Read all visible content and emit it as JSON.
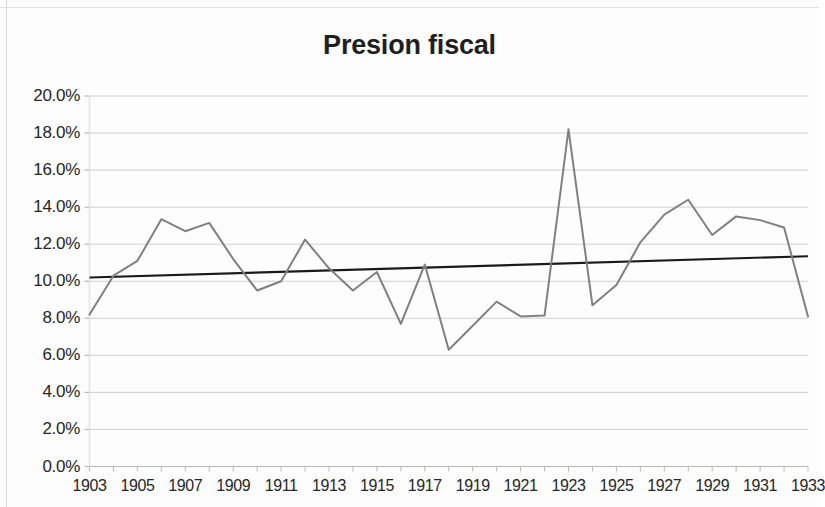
{
  "chart_data": {
    "type": "line",
    "title": "Presion fiscal",
    "xlabel": "",
    "ylabel": "",
    "xlim": [
      1903,
      1933
    ],
    "ylim": [
      0.0,
      20.0
    ],
    "y_unit": "%",
    "grid": true,
    "legend": "none",
    "y_ticks": [
      "0.0%",
      "2.0%",
      "4.0%",
      "6.0%",
      "8.0%",
      "10.0%",
      "12.0%",
      "14.0%",
      "16.0%",
      "18.0%",
      "20.0%"
    ],
    "y_tick_values": [
      0,
      2,
      4,
      6,
      8,
      10,
      12,
      14,
      16,
      18,
      20
    ],
    "x_ticks": [
      "1903",
      "1905",
      "1907",
      "1909",
      "1911",
      "1913",
      "1915",
      "1917",
      "1919",
      "1921",
      "1923",
      "1925",
      "1927",
      "1929",
      "1931",
      "1933"
    ],
    "x_tick_values": [
      1903,
      1905,
      1907,
      1909,
      1911,
      1913,
      1915,
      1917,
      1919,
      1921,
      1923,
      1925,
      1927,
      1929,
      1931,
      1933
    ],
    "x": [
      1903,
      1904,
      1905,
      1906,
      1907,
      1908,
      1909,
      1910,
      1911,
      1912,
      1913,
      1914,
      1915,
      1916,
      1917,
      1918,
      1919,
      1920,
      1921,
      1922,
      1923,
      1924,
      1925,
      1926,
      1927,
      1928,
      1929,
      1930,
      1931,
      1932,
      1933
    ],
    "series": [
      {
        "name": "Presion fiscal",
        "color": "#808080",
        "values": [
          8.2,
          10.3,
          11.1,
          13.35,
          12.7,
          13.15,
          11.2,
          9.5,
          10.0,
          12.25,
          10.7,
          9.5,
          10.5,
          7.7,
          10.9,
          6.3,
          7.6,
          8.9,
          8.1,
          8.15,
          18.2,
          8.7,
          9.8,
          12.1,
          13.6,
          14.4,
          12.5,
          13.5,
          13.3,
          12.9,
          8.1
        ],
        "note_peak_year": 1923,
        "note_peak_value": 18.2
      },
      {
        "name": "Tendencia lineal",
        "color": "#1a1a1a",
        "type": "trendline",
        "start_value": 10.2,
        "end_value": 11.35
      }
    ],
    "line_points": [
      {
        "year": 1903,
        "value": 8.2
      },
      {
        "year": 1904,
        "value": 10.3
      },
      {
        "year": 1905,
        "value": 11.1
      },
      {
        "year": 1906,
        "value": 13.35
      },
      {
        "year": 1907,
        "value": 12.7
      },
      {
        "year": 1908,
        "value": 13.15
      },
      {
        "year": 1909,
        "value": 11.2
      },
      {
        "year": 1910,
        "value": 9.5
      },
      {
        "year": 1911,
        "value": 10.0
      },
      {
        "year": 1912,
        "value": 12.25
      },
      {
        "year": 1913,
        "value": 10.7
      },
      {
        "year": 1914,
        "value": 9.5
      },
      {
        "year": 1915,
        "value": 10.5
      },
      {
        "year": 1916,
        "value": 7.7
      },
      {
        "year": 1917,
        "value": 10.9
      },
      {
        "year": 1918,
        "value": 6.3
      },
      {
        "year": 1919,
        "value": 7.6
      },
      {
        "year": 1920,
        "value": 8.9
      },
      {
        "year": 1921,
        "value": 8.1
      },
      {
        "year": 1922,
        "value": 8.15
      },
      {
        "year": 1923,
        "value": 18.2
      },
      {
        "year": 1924,
        "value": 8.7
      },
      {
        "year": 1925,
        "value": 9.8
      },
      {
        "year": 1926,
        "value": 12.1
      },
      {
        "year": 1927,
        "value": 13.6
      },
      {
        "year": 1928,
        "value": 14.4
      },
      {
        "year": 1929,
        "value": 12.5
      },
      {
        "year": 1930,
        "value": 13.5
      },
      {
        "year": 1931,
        "value": 13.3
      },
      {
        "year": 1932,
        "value": 12.9
      },
      {
        "year": 1933,
        "value": 8.1
      }
    ]
  },
  "colors": {
    "series_line": "#808080",
    "trend_line": "#1a1a1a",
    "grid": "#d0d0d0",
    "axis": "#b8b8b8",
    "text": "#262626"
  }
}
